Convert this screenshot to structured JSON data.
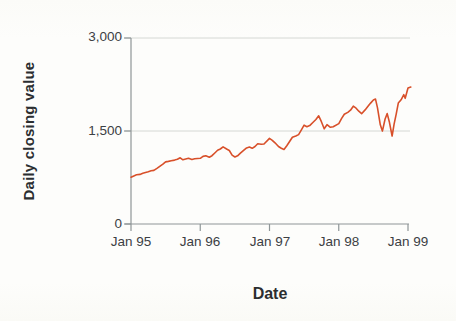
{
  "chart_data": {
    "type": "line",
    "title": "",
    "xlabel": "Date",
    "ylabel": "Daily closing value",
    "x_tick_labels": [
      "Jan 95",
      "Jan 96",
      "Jan 97",
      "Jan 98",
      "Jan 99"
    ],
    "x_tick_values": [
      1995,
      1996,
      1997,
      1998,
      1999
    ],
    "y_tick_labels": [
      "0",
      "1,500",
      "3,000"
    ],
    "y_tick_values": [
      0,
      1500,
      3000
    ],
    "xlim": [
      1995,
      1999.05
    ],
    "ylim": [
      0,
      3000
    ],
    "grid": "horizontal gridlines at 1,500 and 3,000",
    "legend": "none",
    "line_color": "#d8502a",
    "axis_color": "#8f9698",
    "gridline_color": "#d5d8d4",
    "series": [
      {
        "name": "Daily closing value",
        "points": [
          [
            1995.0,
            755
          ],
          [
            1995.04,
            775
          ],
          [
            1995.08,
            793
          ],
          [
            1995.13,
            800
          ],
          [
            1995.17,
            817
          ],
          [
            1995.21,
            830
          ],
          [
            1995.25,
            844
          ],
          [
            1995.29,
            858
          ],
          [
            1995.33,
            865
          ],
          [
            1995.38,
            900
          ],
          [
            1995.42,
            933
          ],
          [
            1995.46,
            965
          ],
          [
            1995.5,
            1001
          ],
          [
            1995.54,
            1010
          ],
          [
            1995.58,
            1020
          ],
          [
            1995.63,
            1030
          ],
          [
            1995.67,
            1044
          ],
          [
            1995.71,
            1067
          ],
          [
            1995.75,
            1036
          ],
          [
            1995.79,
            1048
          ],
          [
            1995.83,
            1059
          ],
          [
            1995.88,
            1040
          ],
          [
            1995.92,
            1052
          ],
          [
            1996.0,
            1060
          ],
          [
            1996.04,
            1090
          ],
          [
            1996.08,
            1100
          ],
          [
            1996.13,
            1077
          ],
          [
            1996.17,
            1101
          ],
          [
            1996.21,
            1145
          ],
          [
            1996.25,
            1191
          ],
          [
            1996.29,
            1210
          ],
          [
            1996.33,
            1243
          ],
          [
            1996.38,
            1210
          ],
          [
            1996.42,
            1185
          ],
          [
            1996.46,
            1110
          ],
          [
            1996.5,
            1081
          ],
          [
            1996.54,
            1100
          ],
          [
            1996.58,
            1142
          ],
          [
            1996.63,
            1190
          ],
          [
            1996.67,
            1227
          ],
          [
            1996.71,
            1240
          ],
          [
            1996.75,
            1221
          ],
          [
            1996.79,
            1250
          ],
          [
            1996.83,
            1293
          ],
          [
            1996.88,
            1287
          ],
          [
            1996.92,
            1291
          ],
          [
            1997.0,
            1380
          ],
          [
            1997.04,
            1350
          ],
          [
            1997.08,
            1309
          ],
          [
            1997.13,
            1250
          ],
          [
            1997.17,
            1222
          ],
          [
            1997.21,
            1201
          ],
          [
            1997.25,
            1261
          ],
          [
            1997.29,
            1330
          ],
          [
            1997.33,
            1400
          ],
          [
            1997.38,
            1420
          ],
          [
            1997.42,
            1442
          ],
          [
            1997.46,
            1520
          ],
          [
            1997.5,
            1594
          ],
          [
            1997.54,
            1570
          ],
          [
            1997.58,
            1587
          ],
          [
            1997.63,
            1640
          ],
          [
            1997.67,
            1686
          ],
          [
            1997.71,
            1745
          ],
          [
            1997.75,
            1650
          ],
          [
            1997.79,
            1535
          ],
          [
            1997.83,
            1601
          ],
          [
            1997.88,
            1560
          ],
          [
            1997.92,
            1570
          ],
          [
            1998.0,
            1619
          ],
          [
            1998.04,
            1700
          ],
          [
            1998.08,
            1771
          ],
          [
            1998.13,
            1800
          ],
          [
            1998.17,
            1836
          ],
          [
            1998.21,
            1900
          ],
          [
            1998.25,
            1868
          ],
          [
            1998.29,
            1820
          ],
          [
            1998.33,
            1779
          ],
          [
            1998.38,
            1840
          ],
          [
            1998.42,
            1895
          ],
          [
            1998.46,
            1950
          ],
          [
            1998.5,
            2000
          ],
          [
            1998.53,
            2014
          ],
          [
            1998.56,
            1872
          ],
          [
            1998.6,
            1600
          ],
          [
            1998.63,
            1499
          ],
          [
            1998.67,
            1694
          ],
          [
            1998.7,
            1780
          ],
          [
            1998.73,
            1650
          ],
          [
            1998.77,
            1419
          ],
          [
            1998.8,
            1611
          ],
          [
            1998.83,
            1771
          ],
          [
            1998.86,
            1950
          ],
          [
            1998.9,
            2003
          ],
          [
            1998.94,
            2085
          ],
          [
            1998.96,
            2028
          ],
          [
            1999.0,
            2193
          ],
          [
            1999.04,
            2210
          ]
        ]
      }
    ]
  }
}
